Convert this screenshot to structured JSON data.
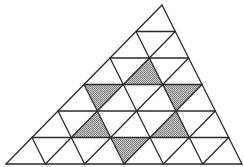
{
  "diagram": {
    "title": "",
    "rows": 6,
    "apex": [
      162,
      5
    ],
    "bottom_left": [
      6,
      164
    ],
    "bottom_right": [
      242,
      164
    ],
    "line_color": "#2a2a2a",
    "fill_color": "#ffffff",
    "shade_color": "#a6a6a6",
    "shaded_triangles": [
      {
        "orientation": "up",
        "vertices": [
          [
            2,
            1
          ],
          [
            3,
            1
          ],
          [
            3,
            2
          ]
        ]
      },
      {
        "orientation": "down",
        "vertices": [
          [
            3,
            0
          ],
          [
            3,
            1
          ],
          [
            4,
            1
          ]
        ]
      },
      {
        "orientation": "down",
        "vertices": [
          [
            3,
            2
          ],
          [
            3,
            3
          ],
          [
            4,
            3
          ]
        ]
      },
      {
        "orientation": "up",
        "vertices": [
          [
            4,
            1
          ],
          [
            5,
            1
          ],
          [
            5,
            2
          ]
        ]
      },
      {
        "orientation": "up",
        "vertices": [
          [
            4,
            3
          ],
          [
            5,
            3
          ],
          [
            5,
            4
          ]
        ]
      },
      {
        "orientation": "down",
        "vertices": [
          [
            5,
            2
          ],
          [
            5,
            3
          ],
          [
            6,
            3
          ]
        ]
      }
    ],
    "shaded_count": 6,
    "total_small_triangles": 36
  }
}
